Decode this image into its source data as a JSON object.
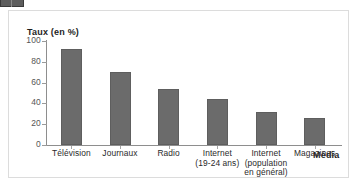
{
  "chart_data": {
    "type": "bar",
    "title": "",
    "subtitle": "",
    "xlabel": "Média",
    "ylabel": "Taux (en %)",
    "ylim": [
      0,
      100
    ],
    "yticks": [
      0,
      20,
      40,
      60,
      80,
      100
    ],
    "ytick_labels": [
      "0",
      "20",
      "40",
      "60",
      "80",
      "100"
    ],
    "grid": false,
    "legend": null,
    "legend_position": "none",
    "categories": [
      "Télévision",
      "Journaux",
      "Radio",
      "Internet\n(19-24 ans)",
      "Internet\n(population\nen général)",
      "Magazines"
    ],
    "values": [
      92,
      70,
      54,
      44,
      32,
      26
    ],
    "bar_color": "#6b6b6b",
    "axis_color": "#8e8e8e",
    "text_color": "#2a2a2a",
    "background_color": "#ffffff",
    "frame_color": "#dcdcdc"
  },
  "figure": {
    "y_axis_title": "Taux (en %)",
    "x_axis_title": "Média"
  }
}
